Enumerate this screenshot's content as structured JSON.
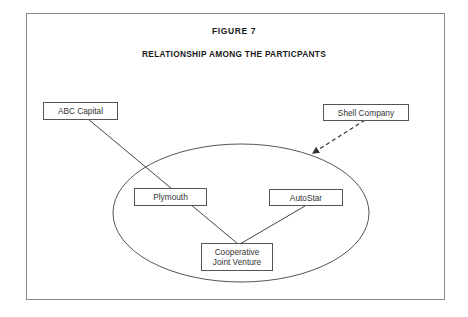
{
  "figure": {
    "label": "FIGURE 7",
    "title": "RELATIONSHIP AMONG THE PARTICPANTS"
  },
  "nodes": {
    "abc_capital": "ABC Capital",
    "shell_company": "Shell Company",
    "plymouth": "Plymouth",
    "autostar": "AutoStar",
    "cjv_line1": "Cooperative",
    "cjv_line2": "Joint Venture"
  },
  "edges": [
    {
      "from": "ABC Capital",
      "to": "Cooperative Joint Venture",
      "style": "solid",
      "via": "Plymouth"
    },
    {
      "from": "Plymouth",
      "to": "Cooperative Joint Venture",
      "style": "solid"
    },
    {
      "from": "AutoStar",
      "to": "Cooperative Joint Venture",
      "style": "solid"
    },
    {
      "from": "Shell Company",
      "to": "ellipse-group",
      "style": "dashed-arrow"
    }
  ],
  "group": {
    "shape": "ellipse",
    "members": [
      "Plymouth",
      "AutoStar",
      "Cooperative Joint Venture"
    ]
  }
}
